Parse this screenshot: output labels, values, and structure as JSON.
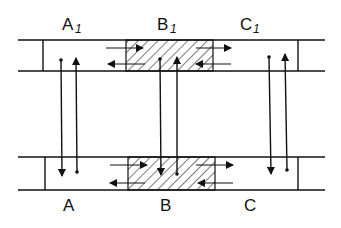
{
  "diagram": {
    "type": "two parallel bands with vertical connecting arrows",
    "top_labels": [
      {
        "main": "A",
        "sub": "1"
      },
      {
        "main": "B",
        "sub": "1"
      },
      {
        "main": "C",
        "sub": "1"
      }
    ],
    "bottom_labels": [
      {
        "main": "A"
      },
      {
        "main": "B"
      },
      {
        "main": "C"
      }
    ],
    "hatched_region": "B",
    "colors": {
      "ink": "#111111",
      "background": "#ffffff"
    }
  }
}
